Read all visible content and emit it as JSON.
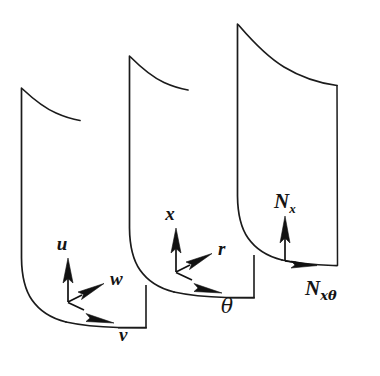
{
  "figure": {
    "name": "cylindrical-shell-coordinates-and-stress-resultants",
    "background_color": "#ffffff",
    "ink_color": "#1b1b1b",
    "panel_count": 3
  },
  "panels": [
    {
      "id": "panel-displacements",
      "position": "left",
      "description": "Curved cylindrical shell panel annotated with displacement components",
      "vectors": [
        {
          "id": "vector-u",
          "label": "u",
          "direction": "axial-up",
          "style": "italic-bold"
        },
        {
          "id": "vector-w",
          "label": "w",
          "direction": "radial-outward-diagonal",
          "style": "italic-bold"
        },
        {
          "id": "vector-v",
          "label": "v",
          "direction": "circumferential-along-bottom-edge",
          "style": "italic-bold"
        }
      ]
    },
    {
      "id": "panel-coordinates",
      "position": "middle",
      "description": "Curved cylindrical shell panel annotated with cylindrical coordinate axes",
      "vectors": [
        {
          "id": "vector-x",
          "label": "x",
          "direction": "axial-up",
          "style": "italic-bold"
        },
        {
          "id": "vector-r",
          "label": "r",
          "direction": "radial-outward-diagonal",
          "style": "italic-bold"
        },
        {
          "id": "vector-theta",
          "label": "θ",
          "direction": "circumferential-along-bottom-edge",
          "style": "italic-greek"
        }
      ]
    },
    {
      "id": "panel-stress-resultants",
      "position": "right",
      "description": "Curved cylindrical shell panel annotated with in-plane stress resultants",
      "vectors": [
        {
          "id": "vector-nx",
          "label": "N",
          "subscript": "x",
          "direction": "axial-up",
          "style": "italic-bold"
        },
        {
          "id": "vector-nxtheta",
          "label": "N",
          "subscript": "xθ",
          "direction": "circumferential-along-bottom-edge",
          "style": "italic-bold"
        }
      ]
    }
  ],
  "labels": {
    "u": "u",
    "w": "w",
    "v": "v",
    "x": "x",
    "r": "r",
    "theta": "θ",
    "N": "N",
    "sub_x": "x",
    "sub_xtheta": "xθ"
  }
}
